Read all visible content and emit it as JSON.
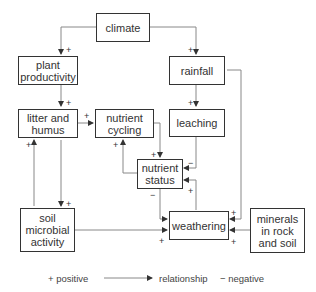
{
  "nodes": {
    "climate": "climate",
    "plant_productivity": "plant productivity",
    "rainfall": "rainfall",
    "litter_humus": "litter and humus",
    "nutrient_cycling": "nutrient cycling",
    "leaching": "leaching",
    "nutrient_status": "nutrient status",
    "soil_microbial": "soil microbial activity",
    "weathering": "weathering",
    "minerals": "minerals in rock and soil"
  },
  "signs": {
    "plus": "+",
    "minus": "−"
  },
  "legend": {
    "positive": "+ positive",
    "relationship": "relationship",
    "negative": "− negative"
  },
  "colors": {
    "line": "#888888",
    "border": "#333333"
  }
}
